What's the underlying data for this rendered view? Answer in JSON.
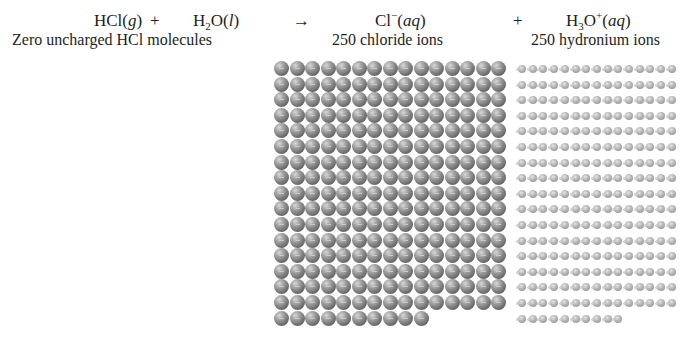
{
  "equation": {
    "reactant1": {
      "formula": "HCl",
      "state": "g"
    },
    "plus1": "+",
    "reactant2": {
      "formula_main": "H",
      "formula_sub": "2",
      "formula_rest": "O",
      "state": "l"
    },
    "arrow": "→",
    "product1": {
      "formula": "Cl",
      "charge": "−",
      "state": "aq"
    },
    "plus2": "+",
    "product2": {
      "formula_main": "H",
      "formula_sub": "3",
      "formula_rest": "O",
      "charge": "+",
      "state": "aq"
    }
  },
  "labels": {
    "hcl": "Zero uncharged HCl molecules",
    "chloride": "250 chloride ions",
    "hydronium": "250 hydronium ions"
  },
  "grids": {
    "chloride": {
      "count": 250,
      "columns": 15,
      "left": 274,
      "top": 61,
      "pitch_x": 15.5,
      "pitch_y": 15.6
    },
    "hydronium": {
      "count": 250,
      "columns": 15,
      "left": 518,
      "top": 65,
      "pitch_x": 10.7,
      "pitch_y": 15.6
    }
  }
}
